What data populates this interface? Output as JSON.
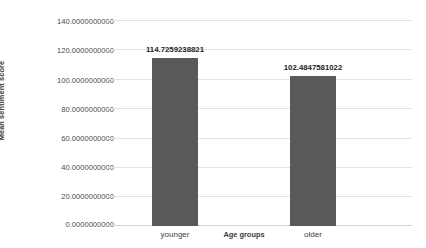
{
  "chart_data": {
    "type": "bar",
    "title": "",
    "subtitle": "",
    "xlabel": "Age groups",
    "ylabel": "Mean sentiment  score",
    "categories": [
      "younger",
      "older"
    ],
    "values": [
      114.7259238821,
      102.4847581022
    ],
    "data_labels": [
      "114.7259238821",
      "102.4847581022"
    ],
    "ylim": [
      0,
      140
    ],
    "ytick_step": 20,
    "ytick_labels": [
      "140.0000000000",
      "120.0000000000",
      "100.0000000000",
      "80.0000000000",
      "60.0000000000",
      "40.0000000000",
      "20.0000000000",
      "0.0000000000"
    ],
    "ytick_values": [
      140,
      120,
      100,
      80,
      60,
      40,
      20,
      0
    ],
    "grid": {
      "horizontal": true,
      "vertical": false
    },
    "legend": {
      "visible": false,
      "position": "none"
    },
    "colors": {
      "bar": "#595959",
      "gridline": "#e2e2e2",
      "baseline": "#d3d3d3",
      "tick_text": "#4a4a4a",
      "axis_title": "#3a3a3a",
      "data_label": "#1d1d1d",
      "background": "#ffffff"
    }
  }
}
